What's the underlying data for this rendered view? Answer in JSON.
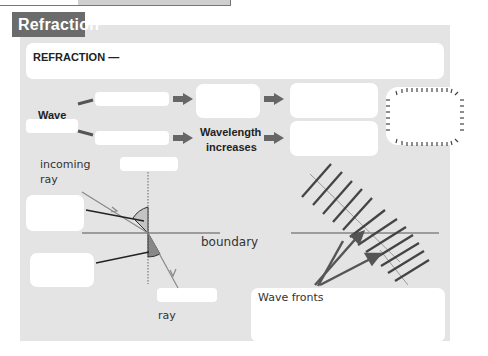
{
  "header": {
    "tag": "Refraction"
  },
  "definition": {
    "label": "REFRACTION —"
  },
  "flow": {
    "wave_label": "Wave",
    "wavelength_label_line1": "Wavelength",
    "wavelength_label_line2": "increases"
  },
  "ray_diagram": {
    "incoming_ray_line1": "incoming",
    "incoming_ray_line2": "ray",
    "boundary": "boundary",
    "ray": "ray"
  },
  "wavefronts": {
    "caption": "Wave fronts"
  },
  "colors": {
    "tag_bg": "#6b6b6b",
    "panel_bg": "#e4e4e4",
    "box_bg": "#ffffff",
    "arrow": "#666666"
  }
}
